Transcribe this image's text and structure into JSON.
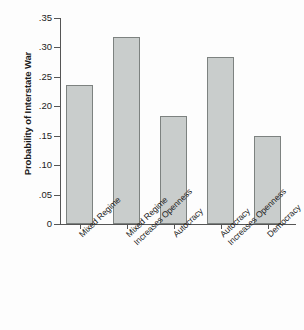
{
  "chart_data": {
    "type": "bar",
    "title": "",
    "xlabel": "",
    "ylabel": "Probability of Interstate War",
    "categories": [
      "Mixed Regime",
      "Mixed Regime Increases Openness",
      "Autocracy",
      "Autocracy Increases Openness",
      "Democracy"
    ],
    "category_lines": [
      [
        "Mixed Regime"
      ],
      [
        "Mixed Regime",
        "Increases Openness"
      ],
      [
        "Autocracy"
      ],
      [
        "Autocracy",
        "Increases Openness"
      ],
      [
        "Democracy"
      ]
    ],
    "values": [
      0.237,
      0.318,
      0.184,
      0.284,
      0.149
    ],
    "ylim": [
      0,
      0.35
    ],
    "yticks": [
      0,
      0.05,
      0.1,
      0.15,
      0.2,
      0.25,
      0.3,
      0.35
    ],
    "ytick_labels": [
      "0",
      ".05",
      ".10",
      ".15",
      ".20",
      ".25",
      ".30",
      ".35"
    ],
    "grid": false,
    "legend": "none",
    "colors": {
      "bar_fill": "#c9cdcc",
      "bar_border": "#7d8280",
      "axis": "#555555",
      "text": "#1b1b1b",
      "background": "#fdfdfd"
    }
  }
}
